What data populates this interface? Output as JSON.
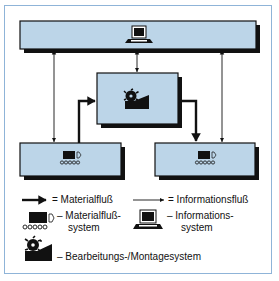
{
  "diagram": {
    "colors": {
      "box_fill": "#bcd5e8",
      "box_border": "#111111",
      "shadow": "#111111",
      "frame": "#8fb4d8"
    },
    "nodes": [
      {
        "id": "information-system",
        "icon": "computer-icon"
      },
      {
        "id": "machining-assembly-system",
        "icon": "milling-cutter-icon"
      },
      {
        "id": "material-flow-system-left",
        "icon": "conveyor-icon"
      },
      {
        "id": "material-flow-system-right",
        "icon": "conveyor-icon"
      }
    ],
    "edges": [
      {
        "from": "information-system",
        "to": "material-flow-system-left",
        "type": "information",
        "bidirectional": true
      },
      {
        "from": "information-system",
        "to": "machining-assembly-system",
        "type": "information",
        "bidirectional": true
      },
      {
        "from": "information-system",
        "to": "material-flow-system-right",
        "type": "information",
        "bidirectional": true
      },
      {
        "from": "material-flow-system-left",
        "to": "machining-assembly-system",
        "type": "material"
      },
      {
        "from": "machining-assembly-system",
        "to": "material-flow-system-right",
        "type": "material"
      }
    ]
  },
  "legend": {
    "material_flow": "= Materialfluß",
    "information_flow": "= Informationsfluß",
    "material_flow_system_line1": "– Materialfluß-",
    "material_flow_system_line2": "system",
    "information_system_line1": "– Informations-",
    "information_system_line2": "system",
    "machining_system": "– Bearbeitungs-/Montagesystem"
  }
}
